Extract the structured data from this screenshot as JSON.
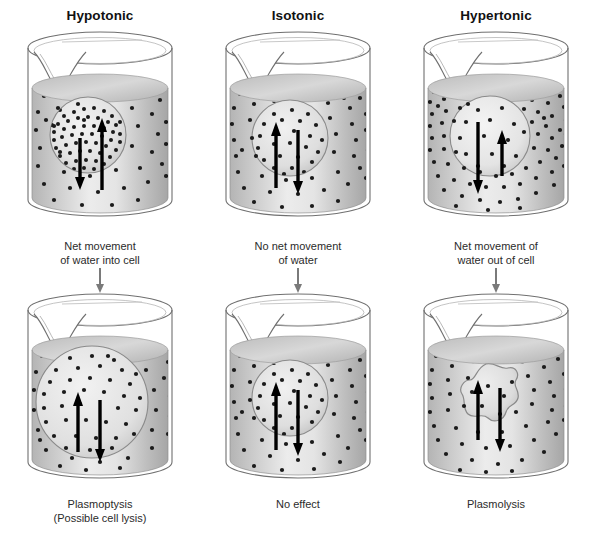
{
  "diagram": {
    "title_row": [
      "Hypotonic",
      "Isotonic",
      "Hypertonic"
    ],
    "columns": [
      {
        "id": "hypotonic",
        "tonicity": "Hypotonic",
        "top": {
          "beaker_label": "beaker-hypotonic-top",
          "solute_outside": "low",
          "solute_inside": "high",
          "cell_shape": "round",
          "arrow_in_label": "water in (long up arrow)",
          "arrow_out_label": "water out (short down arrow)"
        },
        "middle_caption": {
          "line1": "Net movement",
          "line2": "of water into cell"
        },
        "bottom": {
          "beaker_label": "beaker-hypotonic-bottom",
          "cell_shape": "swollen",
          "arrow_in_label": "water in (up arrow)",
          "arrow_out_label": "water out (down arrow)"
        },
        "bottom_caption": {
          "line1": "Plasmoptysis",
          "line2": "(Possible cell lysis)"
        }
      },
      {
        "id": "isotonic",
        "tonicity": "Isotonic",
        "top": {
          "beaker_label": "beaker-isotonic-top",
          "solute_outside": "equal",
          "solute_inside": "equal",
          "cell_shape": "round",
          "arrow_in_label": "water in (up arrow)",
          "arrow_out_label": "water out (down arrow)"
        },
        "middle_caption": {
          "line1": "No net movement",
          "line2": "of water"
        },
        "bottom": {
          "beaker_label": "beaker-isotonic-bottom",
          "cell_shape": "round",
          "arrow_in_label": "water in (up arrow)",
          "arrow_out_label": "water out (down arrow)"
        },
        "bottom_caption": {
          "line1": "No effect",
          "line2": ""
        }
      },
      {
        "id": "hypertonic",
        "tonicity": "Hypertonic",
        "top": {
          "beaker_label": "beaker-hypertonic-top",
          "solute_outside": "high",
          "solute_inside": "low",
          "cell_shape": "round",
          "arrow_in_label": "water in (short up arrow)",
          "arrow_out_label": "water out (long down arrow)"
        },
        "middle_caption": {
          "line1": "Net movement of",
          "line2": "water out of cell"
        },
        "bottom": {
          "beaker_label": "beaker-hypertonic-bottom",
          "cell_shape": "shriveled",
          "arrow_in_label": "water in (up arrow)",
          "arrow_out_label": "water out (down arrow)"
        },
        "bottom_caption": {
          "line1": "Plasmolysis",
          "line2": ""
        }
      }
    ],
    "colors": {
      "background": "#ffffff",
      "glass_outline": "#6b6b6b",
      "liquid_light": "#efefef",
      "liquid_mid": "#c9c9c9",
      "liquid_dark": "#a8a8a8",
      "solute_dot": "#1b1b1b",
      "arrow": "#000000",
      "connector_arrow": "#7a7a7a",
      "text": "#2b2b2b"
    }
  }
}
